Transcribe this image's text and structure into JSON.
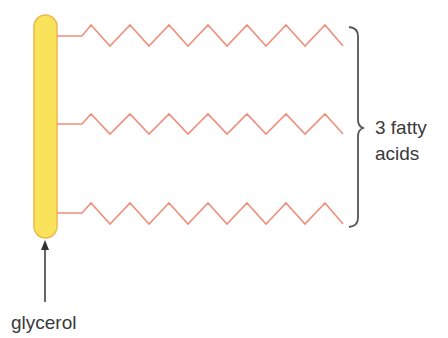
{
  "diagram": {
    "glycerol": {
      "label": "glycerol",
      "fill_color": "#f9e35a",
      "border_color": "#eeb84c"
    },
    "fatty_acids": {
      "count": 3,
      "label_line1": "3 fatty",
      "label_line2": "acids",
      "chain_color": "#ef8f7c"
    },
    "brace_color": "#555555",
    "arrow_color": "#333333"
  }
}
